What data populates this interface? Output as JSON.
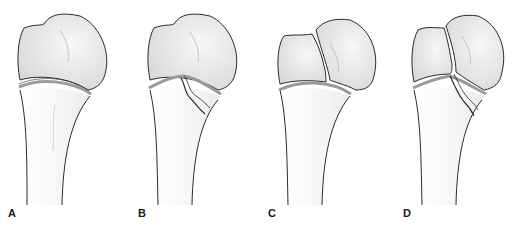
{
  "figure": {
    "panels": [
      {
        "id": "A",
        "label": "A",
        "description": "Intact proximal bone, physis line, no fracture"
      },
      {
        "id": "B",
        "label": "B",
        "description": "Fracture line through metaphysis extending into physis"
      },
      {
        "id": "C",
        "label": "C",
        "description": "Fracture line through epiphysis (head split)"
      },
      {
        "id": "D",
        "label": "D",
        "description": "Fracture through epiphysis, physis and metaphysis"
      }
    ],
    "colors": {
      "outline": "#2a2a2a",
      "head_fill": "#e4e4e4",
      "shaft_fill": "#f6f6f6",
      "physis": "#9a9a9a",
      "background": "#ffffff"
    }
  }
}
